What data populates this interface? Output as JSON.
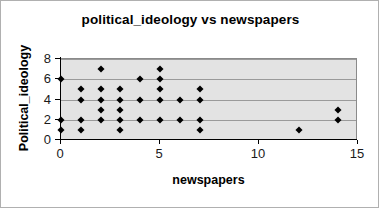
{
  "chart_data": {
    "type": "scatter",
    "title": "political_ideology vs newspapers",
    "xlabel": "newspapers",
    "ylabel": "Political_ideology",
    "xlim": [
      0,
      15
    ],
    "ylim": [
      0,
      8
    ],
    "xticks": [
      "0",
      "5",
      "10",
      "15"
    ],
    "xtick_values": [
      0,
      5,
      10,
      15
    ],
    "yticks": [
      "0",
      "2",
      "4",
      "6",
      "8"
    ],
    "ytick_values": [
      0,
      2,
      4,
      6,
      8
    ],
    "grid": "horizontal",
    "legend": "none",
    "plot_background": "#e3e3e3",
    "marker_color": "#000000",
    "marker_shape": "diamond",
    "x": [
      0,
      0,
      0,
      1,
      1,
      1,
      1,
      2,
      2,
      2,
      2,
      2,
      3,
      3,
      3,
      3,
      3,
      4,
      4,
      4,
      5,
      5,
      5,
      5,
      5,
      6,
      6,
      7,
      7,
      7,
      7,
      12,
      14,
      14
    ],
    "y": [
      6,
      2,
      1,
      5,
      4,
      2,
      1,
      7,
      5,
      4,
      3,
      2,
      5,
      4,
      3,
      2,
      1,
      6,
      4,
      2,
      7,
      6,
      5,
      4,
      2,
      4,
      2,
      5,
      4,
      2,
      1,
      1,
      3,
      2
    ]
  }
}
